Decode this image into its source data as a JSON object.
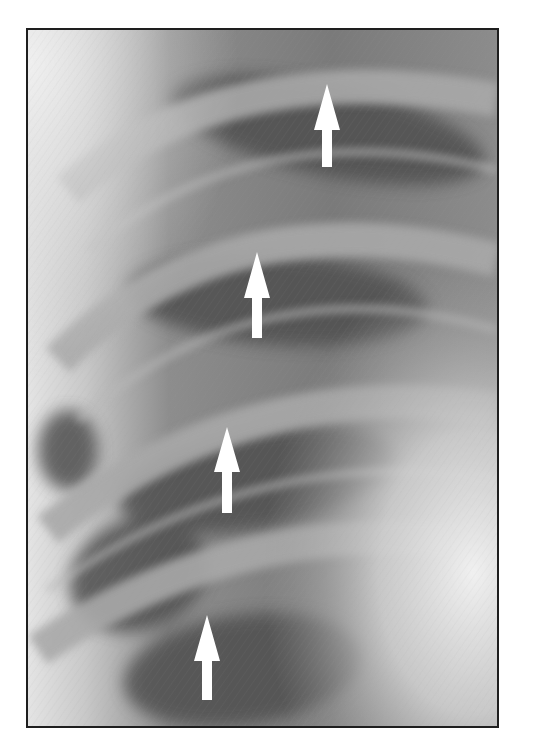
{
  "figure": {
    "type": "radiograph",
    "frame_border_color": "#1e1e1e",
    "background_color": "#ffffff"
  },
  "arrows": [
    {
      "id": 1,
      "direction": "up",
      "color": "#ffffff",
      "tip": [
        326,
        84
      ],
      "bottom": [
        326,
        165
      ]
    },
    {
      "id": 2,
      "direction": "up",
      "color": "#ffffff",
      "tip": [
        256,
        252
      ],
      "bottom": [
        256,
        336
      ]
    },
    {
      "id": 3,
      "direction": "up",
      "color": "#ffffff",
      "tip": [
        226,
        427
      ],
      "bottom": [
        226,
        511
      ]
    },
    {
      "id": 4,
      "direction": "up",
      "color": "#ffffff",
      "tip": [
        206,
        615
      ],
      "bottom": [
        206,
        698
      ]
    }
  ]
}
